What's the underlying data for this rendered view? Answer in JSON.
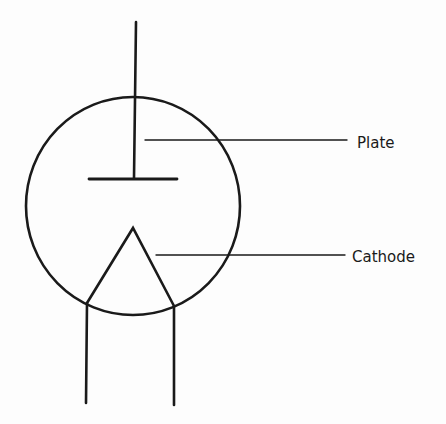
{
  "diagram": {
    "labels": {
      "plate": "Plate",
      "cathode": "Cathode"
    },
    "colors": {
      "background": "#fdfdfd",
      "stroke": "#1a1a1a"
    }
  }
}
